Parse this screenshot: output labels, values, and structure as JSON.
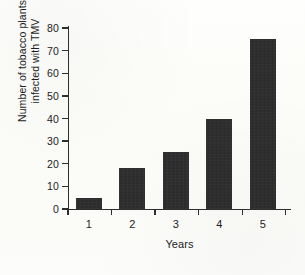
{
  "chart_data": {
    "type": "bar",
    "title": "",
    "categories": [
      "1",
      "2",
      "3",
      "4",
      "5"
    ],
    "values": [
      5,
      18,
      25,
      40,
      75
    ],
    "series": [
      {
        "name": "Number of tobacco plants infected with TMV",
        "values": [
          5,
          18,
          25,
          40,
          75
        ]
      }
    ],
    "xlabel": "Years",
    "ylabel": "Number of tobacco plants infected with TMV",
    "ylabel_lines": [
      "Number of tobacco plants",
      "infected with TMV"
    ],
    "ylim": [
      0,
      80
    ],
    "ytick_labels": [
      "0",
      "10",
      "20",
      "30",
      "40",
      "50",
      "60",
      "70",
      "80"
    ],
    "ytick_values": [
      0,
      10,
      20,
      30,
      40,
      50,
      60,
      70,
      80
    ],
    "xtick_labels": [
      "1",
      "2",
      "3",
      "4",
      "5"
    ],
    "grid": false,
    "legend": false,
    "legend_position": "none",
    "bar_color": "#262626",
    "axis_color": "#2e2e2e",
    "background_color": "#fdfdfb",
    "tick_direction": "out",
    "xtick_placement": "category-boundaries"
  }
}
